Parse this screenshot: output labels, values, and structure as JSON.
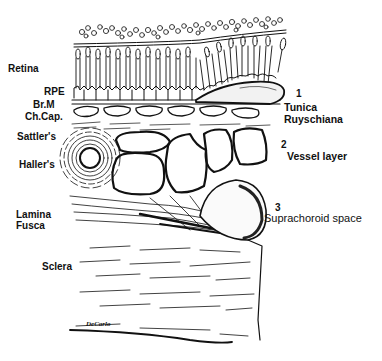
{
  "diagram": {
    "type": "anatomical cross-section illustration",
    "left_labels": [
      {
        "id": "retina",
        "text": "Retina"
      },
      {
        "id": "rpe",
        "text": "RPE"
      },
      {
        "id": "brm",
        "text": "Br.M"
      },
      {
        "id": "chcap",
        "text": "Ch.Cap."
      },
      {
        "id": "sattlers",
        "text": "Sattler's"
      },
      {
        "id": "hallers",
        "text": "Haller's"
      },
      {
        "id": "lamina",
        "text": "Lamina"
      },
      {
        "id": "fusca",
        "text": "Fusca"
      },
      {
        "id": "sclera",
        "text": "Sclera"
      }
    ],
    "right_labels": [
      {
        "number": "1",
        "line1": "Tunica",
        "line2": "Ruyschiana"
      },
      {
        "number": "2",
        "line1": "Vessel  layer"
      },
      {
        "number": "3",
        "line1": "Suprachoroid space"
      }
    ],
    "signature": "DeCarlo"
  }
}
